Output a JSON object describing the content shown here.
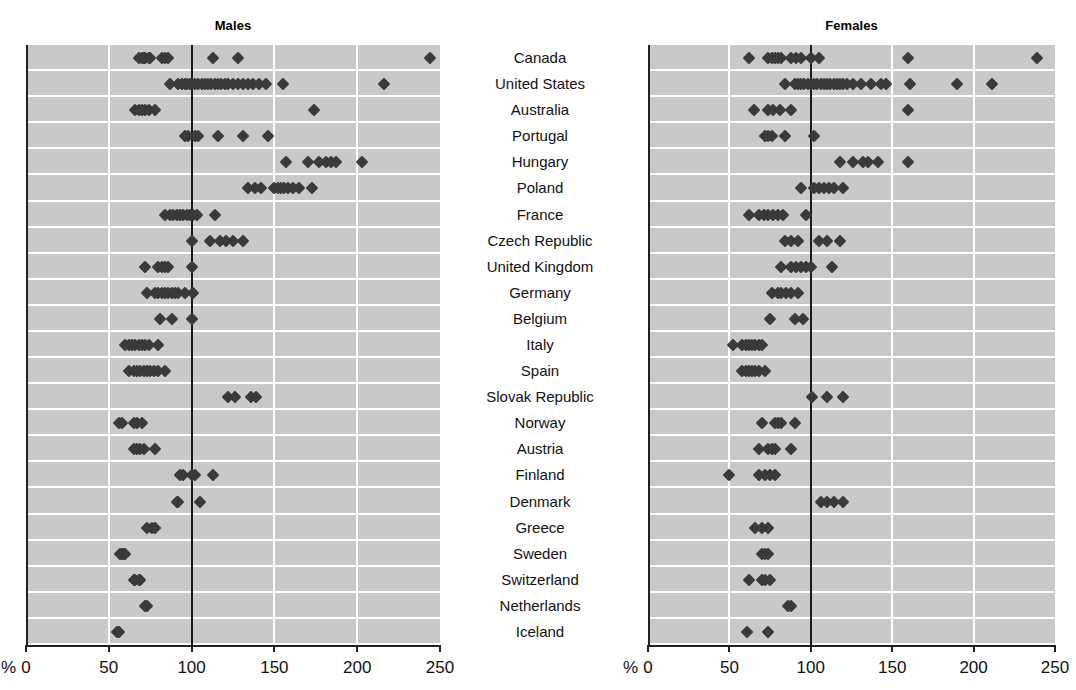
{
  "panels": [
    {
      "id": "males",
      "label": "Males"
    },
    {
      "id": "females",
      "label": "Females"
    }
  ],
  "axis": {
    "unit": "%",
    "ticks": [
      0,
      50,
      100,
      150,
      200,
      250
    ],
    "tick_labels": [
      "0",
      "50",
      "100",
      "150",
      "200",
      "250"
    ],
    "min": 0,
    "max": 250,
    "reference_value": 100
  },
  "colors": {
    "panel_background": "#c9c9c9",
    "gridline": "#ffffff",
    "reference_line": "#1a1a1a",
    "marker": "#3a3a3a",
    "axis": "#222222",
    "text": "#111111"
  },
  "chart_data": {
    "type": "scatter",
    "title": "",
    "xlabel": "%",
    "ylabel": "",
    "xlim": [
      0,
      250
    ],
    "grid": true,
    "legend": "none",
    "panels": [
      "Males",
      "Females"
    ],
    "categories": [
      "Canada",
      "United States",
      "Australia",
      "Portugal",
      "Hungary",
      "Poland",
      "France",
      "Czech Republic",
      "United Kingdom",
      "Germany",
      "Belgium",
      "Italy",
      "Spain",
      "Slovak Republic",
      "Norway",
      "Austria",
      "Finland",
      "Denmark",
      "Greece",
      "Sweden",
      "Switzerland",
      "Netherlands",
      "Iceland"
    ],
    "series": [
      {
        "name": "Males",
        "points_by_category": {
          "Canada": [
            68,
            70,
            71,
            72,
            74,
            75,
            82,
            84,
            86,
            113,
            128,
            244
          ],
          "United States": [
            87,
            92,
            94,
            96,
            97,
            99,
            100,
            102,
            104,
            106,
            108,
            110,
            112,
            114,
            116,
            118,
            120,
            122,
            125,
            128,
            131,
            134,
            137,
            141,
            145,
            155,
            216
          ],
          "Australia": [
            66,
            68,
            70,
            72,
            74,
            78,
            174
          ],
          "Portugal": [
            96,
            98,
            102,
            104,
            116,
            131,
            146
          ],
          "Hungary": [
            157,
            170,
            177,
            181,
            184,
            187,
            203
          ],
          "Poland": [
            134,
            138,
            142,
            150,
            152,
            154,
            156,
            158,
            161,
            165,
            173
          ],
          "France": [
            84,
            87,
            89,
            91,
            93,
            95,
            97,
            99,
            101,
            103,
            114
          ],
          "Czech Republic": [
            100,
            111,
            117,
            121,
            125,
            131
          ],
          "United Kingdom": [
            72,
            80,
            82,
            84,
            86,
            100
          ],
          "Germany": [
            73,
            78,
            80,
            82,
            84,
            86,
            88,
            90,
            92,
            96,
            101
          ],
          "Belgium": [
            81,
            88,
            100
          ],
          "Italy": [
            60,
            62,
            64,
            66,
            68,
            70,
            72,
            74,
            80
          ],
          "Spain": [
            62,
            65,
            67,
            69,
            71,
            73,
            75,
            77,
            80,
            84
          ],
          "Slovak Republic": [
            122,
            126,
            136,
            139
          ],
          "Norway": [
            56,
            58,
            65,
            67,
            70
          ],
          "Austria": [
            65,
            67,
            69,
            71,
            78
          ],
          "Finland": [
            93,
            95,
            100,
            102,
            113
          ],
          "Denmark": [
            91,
            92,
            105
          ],
          "Greece": [
            73,
            76,
            78
          ],
          "Sweden": [
            57,
            58,
            59,
            60
          ],
          "Switzerland": [
            65,
            66,
            68,
            69
          ],
          "Netherlands": [
            72,
            73
          ],
          "Iceland": [
            55,
            56
          ]
        }
      },
      {
        "name": "Females",
        "points_by_category": {
          "Canada": [
            62,
            74,
            76,
            78,
            80,
            82,
            88,
            91,
            94,
            100,
            105,
            160,
            239
          ],
          "United States": [
            84,
            90,
            92,
            94,
            96,
            98,
            100,
            102,
            104,
            106,
            108,
            110,
            112,
            114,
            116,
            118,
            120,
            122,
            126,
            131,
            137,
            143,
            146,
            161,
            190,
            211
          ],
          "Australia": [
            65,
            74,
            77,
            81,
            88,
            160
          ],
          "Portugal": [
            72,
            74,
            76,
            84,
            102
          ],
          "Hungary": [
            118,
            126,
            132,
            135,
            141,
            160
          ],
          "Poland": [
            94,
            102,
            105,
            108,
            111,
            114,
            120
          ],
          "France": [
            62,
            68,
            71,
            74,
            77,
            80,
            83,
            97
          ],
          "Czech Republic": [
            84,
            88,
            92,
            105,
            110,
            118
          ],
          "United Kingdom": [
            82,
            88,
            91,
            94,
            97,
            100,
            113
          ],
          "Germany": [
            76,
            80,
            82,
            85,
            88,
            92
          ],
          "Belgium": [
            75,
            90,
            95
          ],
          "Italy": [
            52,
            58,
            60,
            62,
            64,
            66,
            68,
            70
          ],
          "Spain": [
            58,
            60,
            62,
            64,
            66,
            68,
            72
          ],
          "Slovak Republic": [
            101,
            110,
            120
          ],
          "Norway": [
            70,
            78,
            80,
            82,
            90
          ],
          "Austria": [
            68,
            74,
            76,
            78,
            88
          ],
          "Finland": [
            50,
            68,
            72,
            75,
            78
          ],
          "Denmark": [
            106,
            110,
            114,
            120
          ],
          "Greece": [
            66,
            70,
            74
          ],
          "Sweden": [
            70,
            72,
            74
          ],
          "Switzerland": [
            62,
            70,
            72,
            75
          ],
          "Netherlands": [
            86,
            88
          ],
          "Iceland": [
            61,
            74
          ]
        }
      }
    ]
  }
}
